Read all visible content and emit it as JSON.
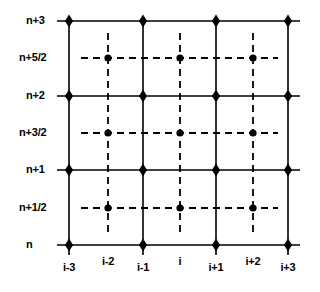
{
  "figure": {
    "background_color": "#ffffff",
    "line_color": "#000000",
    "marker_color": "#000000",
    "geometry": {
      "plot_left": 69,
      "plot_right": 288,
      "plot_top": 21,
      "plot_bottom": 245,
      "solid_x": [
        69,
        143,
        216,
        288
      ],
      "dashed_x": [
        108,
        180,
        253
      ],
      "solid_y": [
        21,
        96,
        170,
        245
      ],
      "dashed_y": [
        58,
        133,
        208
      ],
      "solid_line_width": 1.6,
      "dashed_line_width": 1.8,
      "dash_pattern": "7,5",
      "diamond_radius": 5.2,
      "dot_radius": 3.6
    }
  },
  "chart_data": {
    "type": "scatter",
    "title": "",
    "xlabel": "",
    "ylabel": "",
    "grid": true,
    "legend": null,
    "x_axis": {
      "tick_labels": [
        "i-3",
        "i-2",
        "i-1",
        "i",
        "i+1",
        "i+2",
        "i+3"
      ],
      "tick_pixel_x": [
        69,
        108,
        143,
        180,
        216,
        253,
        288
      ],
      "tick_line_style": [
        "solid",
        "dashed",
        "solid",
        "dashed",
        "solid",
        "dashed",
        "solid"
      ],
      "label_pixel_y": [
        268,
        262,
        268,
        262,
        268,
        262,
        268
      ]
    },
    "y_axis": {
      "tick_labels": [
        "n+3",
        "n+5/2",
        "n+2",
        "n+3/2",
        "n+1",
        "n+1/2",
        "n"
      ],
      "tick_pixel_y": [
        21,
        58,
        96,
        133,
        170,
        208,
        245
      ],
      "tick_line_style": [
        "solid",
        "dashed",
        "solid",
        "dashed",
        "solid",
        "dashed",
        "solid"
      ],
      "label_pixel_x": [
        26,
        19,
        26,
        19,
        26,
        19,
        26
      ]
    },
    "markers": {
      "diamond": {
        "shape": "diamond",
        "description": "integer grid nodes at solid-solid intersections",
        "points": [
          {
            "x": "i-3",
            "y": "n+3"
          },
          {
            "x": "i-1",
            "y": "n+3"
          },
          {
            "x": "i+1",
            "y": "n+3"
          },
          {
            "x": "i+3",
            "y": "n+3"
          },
          {
            "x": "i-3",
            "y": "n+2"
          },
          {
            "x": "i-1",
            "y": "n+2"
          },
          {
            "x": "i+1",
            "y": "n+2"
          },
          {
            "x": "i+3",
            "y": "n+2"
          },
          {
            "x": "i-3",
            "y": "n+1"
          },
          {
            "x": "i-1",
            "y": "n+1"
          },
          {
            "x": "i+1",
            "y": "n+1"
          },
          {
            "x": "i+3",
            "y": "n+1"
          },
          {
            "x": "i-3",
            "y": "n"
          },
          {
            "x": "i-1",
            "y": "n"
          },
          {
            "x": "i+1",
            "y": "n"
          },
          {
            "x": "i+3",
            "y": "n"
          }
        ]
      },
      "circle": {
        "shape": "circle",
        "description": "half-step staggered nodes at dashed-dashed intersections",
        "points": [
          {
            "x": "i-2",
            "y": "n+5/2"
          },
          {
            "x": "i",
            "y": "n+5/2"
          },
          {
            "x": "i+2",
            "y": "n+5/2"
          },
          {
            "x": "i-2",
            "y": "n+3/2"
          },
          {
            "x": "i",
            "y": "n+3/2"
          },
          {
            "x": "i+2",
            "y": "n+3/2"
          },
          {
            "x": "i-2",
            "y": "n+1/2"
          },
          {
            "x": "i",
            "y": "n+1/2"
          },
          {
            "x": "i+2",
            "y": "n+1/2"
          }
        ]
      }
    }
  }
}
